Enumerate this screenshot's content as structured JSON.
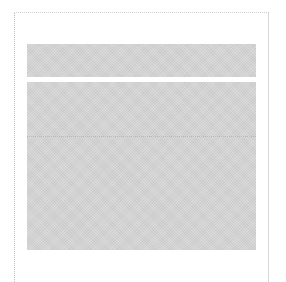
{
  "panel": {
    "header_text": "",
    "state": "loading-placeholder"
  },
  "colors": {
    "background": "#ffffff",
    "frame_border": "#cfcfcf",
    "skeleton_fill": "#d2d2d2",
    "divider": "#b8b8b8"
  }
}
